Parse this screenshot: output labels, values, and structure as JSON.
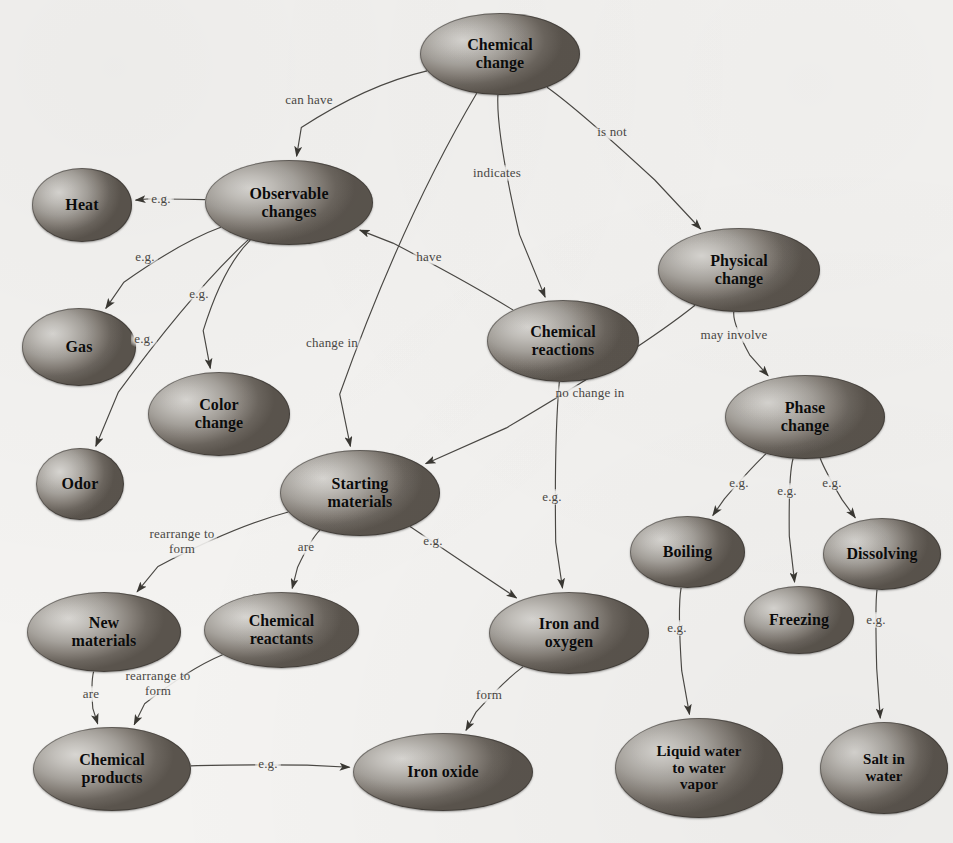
{
  "diagram": {
    "type": "concept-map",
    "background_color": "#f4f3f1",
    "node_fill_light": "#d8d6d2",
    "node_fill_dark": "#5a544d",
    "edge_color": "#4a4844",
    "text_color": "#0b0b0b"
  },
  "nodes": [
    {
      "id": "chemical-change",
      "label": "Chemical\nchange",
      "x": 420,
      "y": 13,
      "w": 160,
      "h": 82,
      "font": 16
    },
    {
      "id": "observable-changes",
      "label": "Observable\nchanges",
      "x": 205,
      "y": 160,
      "w": 168,
      "h": 85,
      "font": 16
    },
    {
      "id": "heat",
      "label": "Heat",
      "x": 32,
      "y": 168,
      "w": 100,
      "h": 74,
      "font": 16
    },
    {
      "id": "gas",
      "label": "Gas",
      "x": 22,
      "y": 308,
      "w": 114,
      "h": 78,
      "font": 16
    },
    {
      "id": "color-change",
      "label": "Color\nchange",
      "x": 148,
      "y": 372,
      "w": 142,
      "h": 84,
      "font": 16
    },
    {
      "id": "odor",
      "label": "Odor",
      "x": 36,
      "y": 448,
      "w": 88,
      "h": 72,
      "font": 16
    },
    {
      "id": "chemical-reactions",
      "label": "Chemical\nreactions",
      "x": 487,
      "y": 300,
      "w": 152,
      "h": 82,
      "font": 16
    },
    {
      "id": "physical-change",
      "label": "Physical\nchange",
      "x": 658,
      "y": 228,
      "w": 162,
      "h": 84,
      "font": 16
    },
    {
      "id": "phase-change",
      "label": "Phase\nchange",
      "x": 725,
      "y": 375,
      "w": 160,
      "h": 84,
      "font": 16
    },
    {
      "id": "starting-materials",
      "label": "Starting\nmaterials",
      "x": 280,
      "y": 450,
      "w": 160,
      "h": 86,
      "font": 16
    },
    {
      "id": "new-materials",
      "label": "New\nmaterials",
      "x": 27,
      "y": 592,
      "w": 154,
      "h": 80,
      "font": 16
    },
    {
      "id": "chemical-reactants",
      "label": "Chemical\nreactants",
      "x": 204,
      "y": 592,
      "w": 155,
      "h": 76,
      "font": 16
    },
    {
      "id": "chemical-products",
      "label": "Chemical\nproducts",
      "x": 33,
      "y": 727,
      "w": 158,
      "h": 84,
      "font": 16
    },
    {
      "id": "iron-oxide",
      "label": "Iron oxide",
      "x": 353,
      "y": 733,
      "w": 180,
      "h": 78,
      "font": 16
    },
    {
      "id": "iron-and-oxygen",
      "label": "Iron and\noxygen",
      "x": 489,
      "y": 592,
      "w": 160,
      "h": 82,
      "font": 16
    },
    {
      "id": "boiling",
      "label": "Boiling",
      "x": 630,
      "y": 516,
      "w": 115,
      "h": 72,
      "font": 16
    },
    {
      "id": "freezing",
      "label": "Freezing",
      "x": 744,
      "y": 586,
      "w": 110,
      "h": 68,
      "font": 16
    },
    {
      "id": "dissolving",
      "label": "Dissolving",
      "x": 823,
      "y": 518,
      "w": 118,
      "h": 72,
      "font": 16
    },
    {
      "id": "liquid-water-vapor",
      "label": "Liquid water\nto water\nvapor",
      "x": 615,
      "y": 718,
      "w": 168,
      "h": 100,
      "font": 15
    },
    {
      "id": "salt-in-water",
      "label": "Salt in\nwater",
      "x": 820,
      "y": 722,
      "w": 128,
      "h": 92,
      "font": 15
    }
  ],
  "edges": [
    {
      "id": "cc-oc",
      "from": "chemical-change",
      "to": "observable-changes",
      "label": "can have",
      "label_x": 306,
      "label_y": 99
    },
    {
      "id": "cc-sm",
      "from": "chemical-change",
      "to": "starting-materials",
      "label": "change in",
      "label_x": 329,
      "label_y": 342
    },
    {
      "id": "cc-cr",
      "from": "chemical-change",
      "to": "chemical-reactions",
      "label": "indicates",
      "label_x": 494,
      "label_y": 172
    },
    {
      "id": "cc-pc",
      "from": "chemical-change",
      "to": "physical-change",
      "label": "is not",
      "label_x": 609,
      "label_y": 131
    },
    {
      "id": "oc-heat",
      "from": "observable-changes",
      "to": "heat",
      "label": "e.g.",
      "label_x": 158,
      "label_y": 198
    },
    {
      "id": "oc-gas",
      "from": "observable-changes",
      "to": "gas",
      "label": "e.g.",
      "label_x": 142,
      "label_y": 256
    },
    {
      "id": "oc-col",
      "from": "observable-changes",
      "to": "color-change",
      "label": "e.g.",
      "label_x": 196,
      "label_y": 293
    },
    {
      "id": "oc-odor",
      "from": "observable-changes",
      "to": "odor",
      "label": "e.g.",
      "label_x": 141,
      "label_y": 338
    },
    {
      "id": "cr-oc",
      "from": "chemical-reactions",
      "to": "observable-changes",
      "label": "have",
      "label_x": 426,
      "label_y": 256
    },
    {
      "id": "pc-sm",
      "from": "physical-change",
      "to": "starting-materials",
      "label": "no change in",
      "label_x": 587,
      "label_y": 392
    },
    {
      "id": "pc-ph",
      "from": "physical-change",
      "to": "phase-change",
      "label": "may involve",
      "label_x": 731,
      "label_y": 334
    },
    {
      "id": "cr-io",
      "from": "chemical-reactions",
      "to": "iron-and-oxygen",
      "label": "e.g.",
      "label_x": 549,
      "label_y": 496
    },
    {
      "id": "sm-nm",
      "from": "starting-materials",
      "to": "new-materials",
      "label": "rearrange to\nform",
      "label_x": 179,
      "label_y": 541
    },
    {
      "id": "sm-crt",
      "from": "starting-materials",
      "to": "chemical-reactants",
      "label": "are",
      "label_x": 303,
      "label_y": 546
    },
    {
      "id": "sm-io",
      "from": "starting-materials",
      "to": "iron-and-oxygen",
      "label": "e.g.",
      "label_x": 430,
      "label_y": 540
    },
    {
      "id": "nm-cp",
      "from": "new-materials",
      "to": "chemical-products",
      "label": "are",
      "label_x": 88,
      "label_y": 693
    },
    {
      "id": "crt-cp",
      "from": "chemical-reactants",
      "to": "chemical-products",
      "label": "rearrange to\nform",
      "label_x": 155,
      "label_y": 683
    },
    {
      "id": "cp-ixo",
      "from": "chemical-products",
      "to": "iron-oxide",
      "label": "e.g.",
      "label_x": 265,
      "label_y": 763
    },
    {
      "id": "io-ixo",
      "from": "iron-and-oxygen",
      "to": "iron-oxide",
      "label": "form",
      "label_x": 486,
      "label_y": 694
    },
    {
      "id": "ph-boil",
      "from": "phase-change",
      "to": "boiling",
      "label": "e.g.",
      "label_x": 736,
      "label_y": 482
    },
    {
      "id": "ph-frz",
      "from": "phase-change",
      "to": "freezing",
      "label": "e.g.",
      "label_x": 784,
      "label_y": 490
    },
    {
      "id": "ph-dis",
      "from": "phase-change",
      "to": "dissolving",
      "label": "e.g.",
      "label_x": 829,
      "label_y": 482
    },
    {
      "id": "boil-lw",
      "from": "boiling",
      "to": "liquid-water-vapor",
      "label": "e.g.",
      "label_x": 674,
      "label_y": 627
    },
    {
      "id": "dis-salt",
      "from": "dissolving",
      "to": "salt-in-water",
      "label": "e.g.",
      "label_x": 873,
      "label_y": 619
    }
  ]
}
